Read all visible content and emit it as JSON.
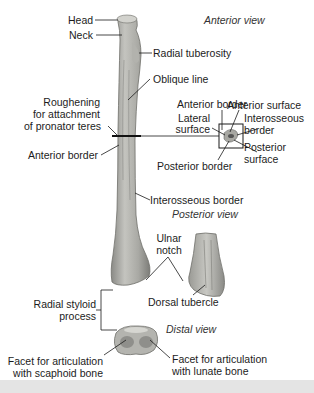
{
  "figure": {
    "views": {
      "anterior": "Anterior view",
      "posterior": "Posterior view",
      "distal": "Distal view"
    },
    "labels": {
      "head": "Head",
      "neck": "Neck",
      "radial_tuberosity": "Radial tuberosity",
      "oblique_line": "Oblique line",
      "roughening_1": "Roughening",
      "roughening_2": "for attachment",
      "roughening_3": "of pronator teres",
      "anterior_border_left": "Anterior border",
      "interosseous_border": "Interosseous border",
      "ulnar_notch_1": "Ulnar",
      "ulnar_notch_2": "notch",
      "radial_styloid_1": "Radial styloid",
      "radial_styloid_2": "process",
      "dorsal_tubercle": "Dorsal tubercle",
      "facet_scaphoid_1": "Facet for articulation",
      "facet_scaphoid_2": "with scaphoid bone",
      "facet_lunate_1": "Facet for articulation",
      "facet_lunate_2": "with lunate bone"
    },
    "cross_section": {
      "anterior_border": "Anterior border",
      "anterior_surface": "Anterior surface",
      "lateral_1": "Lateral",
      "lateral_2": "surface",
      "interosseous_1": "Interosseous",
      "interosseous_2": "border",
      "posterior_surface_1": "Posterior",
      "posterior_surface_2": "surface",
      "posterior_border": "Posterior border"
    },
    "colors": {
      "bone_light": "#c9c9c4",
      "bone_mid": "#a8a8a3",
      "bone_dark": "#7e7e7a",
      "leader": "#1a1a1a",
      "band": "#e4e4e4"
    }
  }
}
